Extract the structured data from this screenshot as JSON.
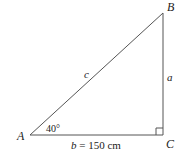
{
  "diagram": {
    "type": "right-triangle",
    "vertices": {
      "A": {
        "label": "A"
      },
      "B": {
        "label": "B"
      },
      "C": {
        "label": "C"
      }
    },
    "sides": {
      "a": {
        "label": "a"
      },
      "b": {
        "label_var": "b",
        "label_value": " = 150 cm"
      },
      "c": {
        "label": "c"
      }
    },
    "angle_A": {
      "label": "40°"
    },
    "right_angle_at": "C",
    "colors": {
      "stroke": "#555555",
      "text": "#222222",
      "background": "#ffffff"
    }
  }
}
